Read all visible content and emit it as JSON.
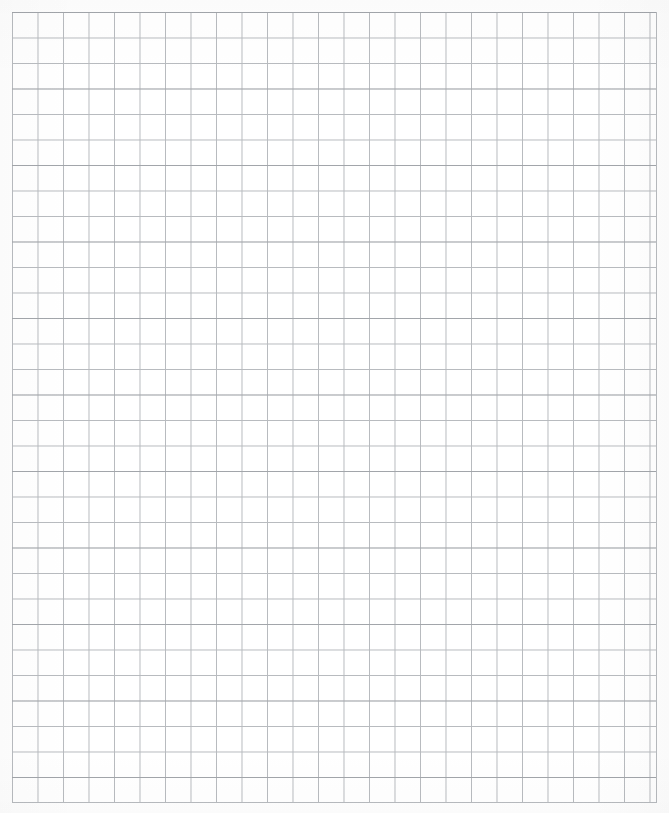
{
  "document": {
    "kind": "graph-paper-scan",
    "page_width_px": 669,
    "page_height_px": 813,
    "background_color": "#ffffff",
    "has_text": false,
    "has_handwriting": false,
    "has_annotations": false
  },
  "grid": {
    "line_color": "#b7babe",
    "emphasis_line_color": "#82868b",
    "cell_size_px": 25.5,
    "columns": 25,
    "rows": 31,
    "left_px": 12,
    "top_px": 12,
    "right_px": 657,
    "bottom_px": 803,
    "width_px": 645,
    "height_px": 791,
    "line_width_px": 0.9,
    "style": "square"
  },
  "margins": {
    "top_px": 12,
    "left_px": 12,
    "right_px": 12,
    "bottom_px": 10,
    "color": "#ffffff"
  }
}
